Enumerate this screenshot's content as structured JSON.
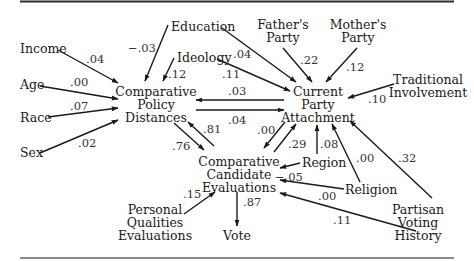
{
  "diagram": {
    "type": "path-diagram",
    "nodes": [
      {
        "id": "education",
        "lines": [
          "Education"
        ]
      },
      {
        "id": "fathers_party",
        "lines": [
          "Father's",
          "Party"
        ]
      },
      {
        "id": "mothers_party",
        "lines": [
          "Mother's",
          "Party"
        ]
      },
      {
        "id": "income",
        "lines": [
          "Income"
        ]
      },
      {
        "id": "ideology",
        "lines": [
          "Ideology"
        ]
      },
      {
        "id": "traditional_involvement",
        "lines": [
          "Traditional",
          "Involvement"
        ]
      },
      {
        "id": "age",
        "lines": [
          "Age"
        ]
      },
      {
        "id": "race",
        "lines": [
          "Race"
        ]
      },
      {
        "id": "sex",
        "lines": [
          "Sex"
        ]
      },
      {
        "id": "comparative_policy_distances",
        "lines": [
          "Comparative",
          "Policy",
          "Distances"
        ]
      },
      {
        "id": "current_party_attachment",
        "lines": [
          "Current",
          "Party",
          "Attachment"
        ]
      },
      {
        "id": "region",
        "lines": [
          "Region"
        ]
      },
      {
        "id": "religion",
        "lines": [
          "Religion"
        ]
      },
      {
        "id": "comparative_candidate_evaluations",
        "lines": [
          "Comparative",
          "Candidate",
          "Evaluations"
        ]
      },
      {
        "id": "personal_qualities_evaluations",
        "lines": [
          "Personal",
          "Qualities",
          "Evaluations"
        ]
      },
      {
        "id": "vote",
        "lines": [
          "Vote"
        ]
      },
      {
        "id": "partisan_voting_history",
        "lines": [
          "Partisan",
          "Voting",
          "History"
        ]
      }
    ],
    "edges": [
      {
        "from": "income",
        "to": "comparative_policy_distances",
        "label": ".04"
      },
      {
        "from": "age",
        "to": "comparative_policy_distances",
        "label": ".00"
      },
      {
        "from": "race",
        "to": "comparative_policy_distances",
        "label": ".07"
      },
      {
        "from": "sex",
        "to": "comparative_policy_distances",
        "label": ".02"
      },
      {
        "from": "education",
        "to": "comparative_policy_distances",
        "label": "−.03"
      },
      {
        "from": "ideology",
        "to": "comparative_policy_distances",
        "label": ".12"
      },
      {
        "from": "education",
        "to": "current_party_attachment",
        "label": ".04"
      },
      {
        "from": "ideology",
        "to": "current_party_attachment",
        "label": ".11"
      },
      {
        "from": "fathers_party",
        "to": "current_party_attachment",
        "label": ".22"
      },
      {
        "from": "mothers_party",
        "to": "current_party_attachment",
        "label": ".12"
      },
      {
        "from": "traditional_involvement",
        "to": "current_party_attachment",
        "label": ".10"
      },
      {
        "from": "current_party_attachment",
        "to": "comparative_policy_distances",
        "label": ".03"
      },
      {
        "from": "comparative_policy_distances",
        "to": "current_party_attachment",
        "label": ".04"
      },
      {
        "from": "comparative_policy_distances",
        "to": "comparative_candidate_evaluations",
        "label": ".76"
      },
      {
        "from": "comparative_candidate_evaluations",
        "to": "comparative_policy_distances",
        "label": ".81"
      },
      {
        "from": "current_party_attachment",
        "to": "comparative_candidate_evaluations",
        "label": ".00"
      },
      {
        "from": "comparative_candidate_evaluations",
        "to": "current_party_attachment",
        "label": ".29"
      },
      {
        "from": "region",
        "to": "current_party_attachment",
        "label": ".08"
      },
      {
        "from": "region",
        "to": "comparative_candidate_evaluations",
        "label": "−.05"
      },
      {
        "from": "religion",
        "to": "current_party_attachment",
        "label": ".00"
      },
      {
        "from": "religion",
        "to": "comparative_candidate_evaluations",
        "label": ".00"
      },
      {
        "from": "partisan_voting_history",
        "to": "current_party_attachment",
        "label": ".32"
      },
      {
        "from": "partisan_voting_history",
        "to": "comparative_candidate_evaluations",
        "label": ".11"
      },
      {
        "from": "personal_qualities_evaluations",
        "to": "comparative_candidate_evaluations",
        "label": ".15"
      },
      {
        "from": "comparative_candidate_evaluations",
        "to": "vote",
        "label": ".87"
      }
    ]
  },
  "labels": {
    "education": "Education",
    "fathers_1": "Father's",
    "fathers_2": "Party",
    "mothers_1": "Mother's",
    "mothers_2": "Party",
    "income": "Income",
    "ideology": "Ideology",
    "trad_1": "Traditional",
    "trad_2": "Involvement",
    "age": "Age",
    "race": "Race",
    "sex": "Sex",
    "cpd_1": "Comparative",
    "cpd_2": "Policy",
    "cpd_3": "Distances",
    "cpa_1": "Current",
    "cpa_2": "Party",
    "cpa_3": "Attachment",
    "region": "Region",
    "religion": "Religion",
    "cce_1": "Comparative",
    "cce_2": "Candidate",
    "cce_3": "Evaluations",
    "pqe_1": "Personal",
    "pqe_2": "Qualities",
    "pqe_3": "Evaluations",
    "vote": "Vote",
    "pvh_1": "Partisan",
    "pvh_2": "Voting",
    "pvh_3": "History"
  },
  "coefficients": {
    "income_cpd": ".04",
    "age_cpd": ".00",
    "race_cpd": ".07",
    "sex_cpd": ".02",
    "edu_cpd": "−.03",
    "ideo_cpd": ".12",
    "edu_cpa": ".04",
    "ideo_cpa": ".11",
    "father_cpa": ".22",
    "mother_cpa": ".12",
    "trad_cpa": ".10",
    "cpa_cpd": ".03",
    "cpd_cpa": ".04",
    "cpd_cce": ".76",
    "cce_cpd": ".81",
    "cpa_cce": ".00",
    "cce_cpa": ".29",
    "region_cpa": ".08",
    "region_cce": "−.05",
    "religion_cpa": ".00",
    "religion_cce": ".00",
    "pvh_cpa": ".32",
    "pvh_cce": ".11",
    "pqe_cce": ".15",
    "cce_vote": ".87"
  }
}
